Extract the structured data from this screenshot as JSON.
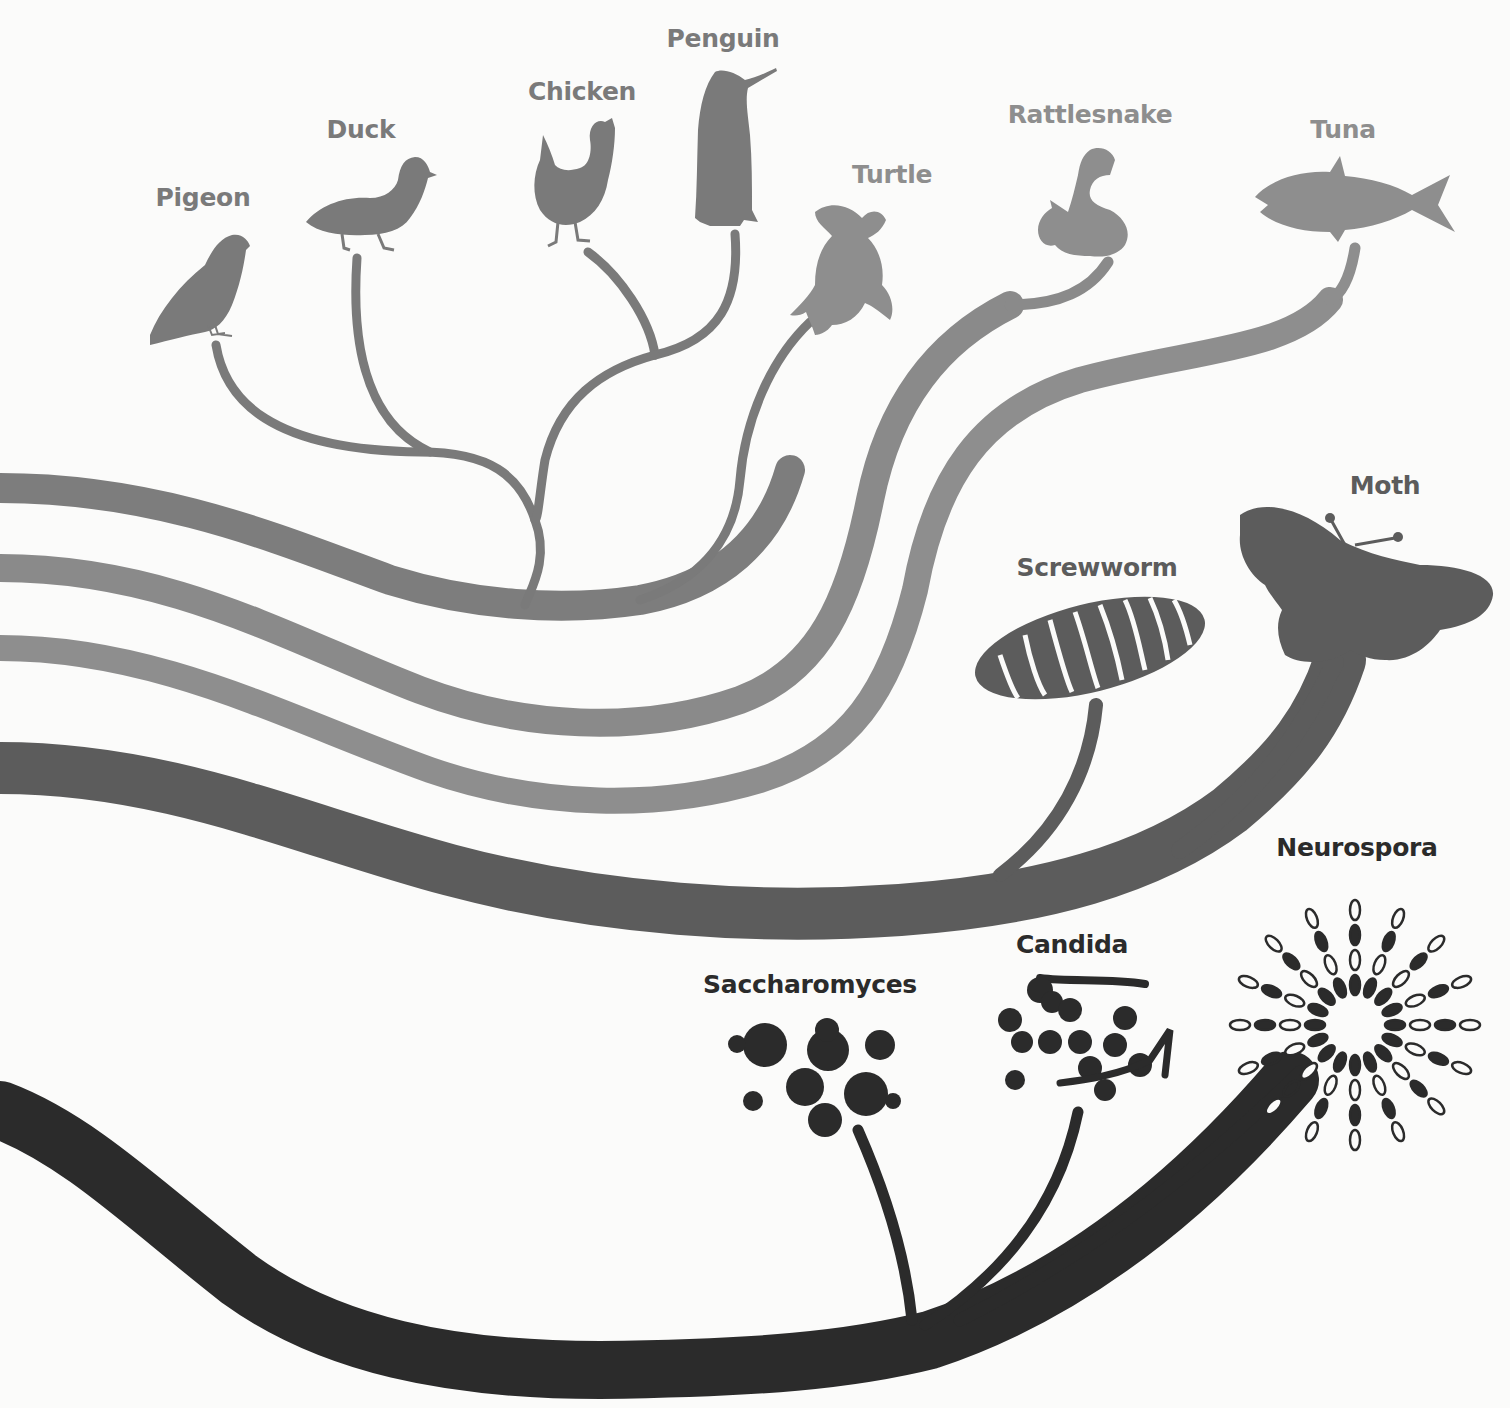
{
  "diagram": {
    "type": "phylogenetic-tree",
    "colors": {
      "background": "#fbfbfa",
      "birds": "#7a7a7a",
      "reptiles_fish": "#8e8e8e",
      "insects": "#5c5c5c",
      "fungi": "#2b2b2b"
    },
    "clades": [
      {
        "name": "birds",
        "taxa": [
          "Pigeon",
          "Duck",
          "Chicken",
          "Penguin"
        ]
      },
      {
        "name": "reptiles",
        "taxa": [
          "Turtle",
          "Rattlesnake"
        ]
      },
      {
        "name": "fish",
        "taxa": [
          "Tuna"
        ]
      },
      {
        "name": "insects",
        "taxa": [
          "Screwworm",
          "Moth"
        ]
      },
      {
        "name": "fungi",
        "taxa": [
          "Saccharomyces",
          "Candida",
          "Neurospora"
        ]
      }
    ]
  },
  "labels": {
    "pigeon": "Pigeon",
    "duck": "Duck",
    "chicken": "Chicken",
    "penguin": "Penguin",
    "turtle": "Turtle",
    "rattlesnake": "Rattlesnake",
    "tuna": "Tuna",
    "moth": "Moth",
    "screwworm": "Screwworm",
    "candida": "Candida",
    "neurospora": "Neurospora",
    "saccharomyces": "Saccharomyces"
  },
  "icons": {
    "pigeon": "pigeon-silhouette",
    "duck": "duck-silhouette",
    "chicken": "chicken-silhouette",
    "penguin": "penguin-silhouette",
    "turtle": "sea-turtle-silhouette",
    "rattlesnake": "coiled-snake-silhouette",
    "tuna": "tuna-fish-silhouette",
    "moth": "moth-silhouette",
    "screwworm": "segmented-larva-silhouette",
    "saccharomyces": "budding-yeast-cells",
    "candida": "yeast-cells-with-hyphae",
    "neurospora": "radiating-spore-chains"
  }
}
